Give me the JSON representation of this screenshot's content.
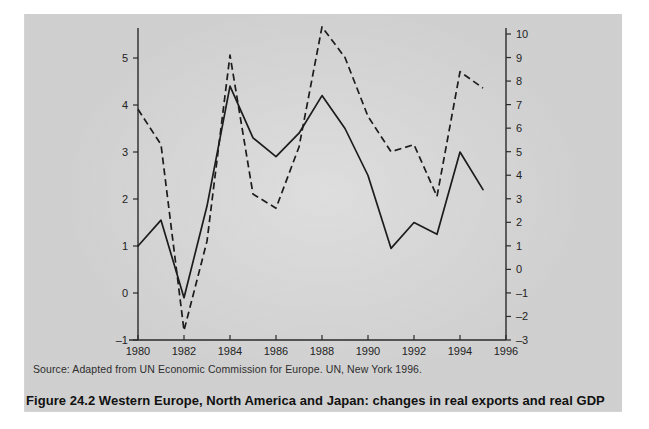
{
  "figure": {
    "caption": "Figure 24.2  Western Europe, North America and Japan: changes in real exports and real GDP",
    "source_note": "Source: Adapted from UN Economic Commission for Europe. UN, New York 1996."
  },
  "colors": {
    "panel_background": "#d5d5d5",
    "page_background": "#ffffff",
    "ink": "#1c1c1c",
    "axis": "#2a2a2a"
  },
  "axes": {
    "x_ticks": [
      "1980",
      "1982",
      "1984",
      "1986",
      "1988",
      "1990",
      "1992",
      "1994",
      "1996"
    ],
    "y_left_ticks": [
      "5",
      "4",
      "3",
      "2",
      "1",
      "0",
      "-1"
    ],
    "y_right_ticks": [
      "10",
      "9",
      "8",
      "7",
      "6",
      "5",
      "4",
      "3",
      "2",
      "1",
      "0",
      "-1",
      "-2",
      "-3"
    ]
  },
  "chart_data": {
    "type": "line",
    "title": "Figure 24.2  Western Europe, North America and Japan: changes in real exports and real GDP",
    "subtitle": "",
    "xlabel": "",
    "ylabel": "",
    "y2label": "",
    "grid": false,
    "legend": "none",
    "xlim": [
      1980,
      1996
    ],
    "ylim": [
      -1,
      5.5
    ],
    "y2lim": [
      -3,
      10.4
    ],
    "x": [
      1980,
      1981,
      1982,
      1983,
      1984,
      1985,
      1986,
      1987,
      1988,
      1989,
      1990,
      1991,
      1992,
      1993,
      1994,
      1995
    ],
    "series": [
      {
        "name": "real GDP",
        "style": "solid",
        "axis": "left",
        "values": [
          1.0,
          1.55,
          -0.1,
          1.85,
          4.4,
          3.3,
          2.9,
          3.4,
          4.2,
          3.5,
          2.5,
          0.95,
          1.5,
          1.25,
          3.0,
          2.2
        ]
      },
      {
        "name": "real exports",
        "style": "dashed",
        "axis": "right",
        "values": [
          6.8,
          5.3,
          -2.6,
          1.2,
          9.1,
          3.2,
          2.6,
          5.2,
          10.3,
          9.0,
          6.5,
          5.0,
          5.3,
          3.1,
          8.4,
          7.7
        ]
      }
    ]
  }
}
